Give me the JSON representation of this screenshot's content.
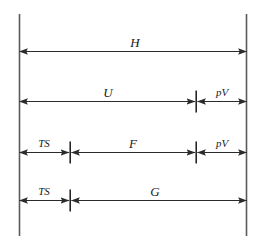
{
  "figure": {
    "type": "thermodynamic-potentials-bar-diagram",
    "colors": {
      "rule": "#5a5a5a",
      "arrow": "#2b2b2b",
      "tick": "#1a1a1a",
      "text": "#1a1a1a",
      "background": "#ffffff",
      "caption": "#cfcfcf"
    },
    "boundaries": {
      "left_rail": {
        "name": "left-boundary-line",
        "x": 19,
        "y_top": 14,
        "y_bottom": 236
      },
      "right_rail": {
        "name": "right-boundary-line",
        "x": 246,
        "y_top": 14,
        "y_bottom": 236
      }
    },
    "rows": [
      {
        "id": "row-h",
        "y": 51,
        "segments": [
          {
            "id": "seg-h",
            "label": "H",
            "label_size": "main",
            "x1": 19,
            "x2": 246,
            "label_x": 135,
            "label_y": 42,
            "arrow_start": true,
            "arrow_end": true
          }
        ],
        "ticks": []
      },
      {
        "id": "row-u-pv",
        "y": 101,
        "segments": [
          {
            "id": "seg-u",
            "label": "U",
            "label_size": "main",
            "x1": 19,
            "x2": 195,
            "label_x": 108,
            "label_y": 92,
            "arrow_start": true,
            "arrow_end": true
          },
          {
            "id": "seg-pv-upper",
            "label": "pV",
            "label_size": "small",
            "x1": 197,
            "x2": 246,
            "label_x": 222,
            "label_y": 92,
            "arrow_start": true,
            "arrow_end": true
          }
        ],
        "ticks": [
          {
            "id": "tick-u-pv",
            "x": 196,
            "half_height": 11
          }
        ]
      },
      {
        "id": "row-ts-f-pv",
        "y": 152,
        "segments": [
          {
            "id": "seg-ts-upper",
            "label": "TS",
            "label_size": "small",
            "x1": 19,
            "x2": 69,
            "label_x": 44,
            "label_y": 143,
            "arrow_start": true,
            "arrow_end": true
          },
          {
            "id": "seg-f",
            "label": "F",
            "label_size": "main",
            "x1": 71,
            "x2": 195,
            "label_x": 133,
            "label_y": 143,
            "arrow_start": true,
            "arrow_end": true
          },
          {
            "id": "seg-pv-lower",
            "label": "pV",
            "label_size": "small",
            "x1": 197,
            "x2": 246,
            "label_x": 222,
            "label_y": 143,
            "arrow_start": true,
            "arrow_end": true
          }
        ],
        "ticks": [
          {
            "id": "tick-ts-f",
            "x": 70,
            "half_height": 11
          },
          {
            "id": "tick-f-pv",
            "x": 196,
            "half_height": 11
          }
        ]
      },
      {
        "id": "row-ts-g",
        "y": 200,
        "segments": [
          {
            "id": "seg-ts-lower",
            "label": "TS",
            "label_size": "small",
            "x1": 19,
            "x2": 69,
            "label_x": 44,
            "label_y": 191,
            "arrow_start": true,
            "arrow_end": true
          },
          {
            "id": "seg-g",
            "label": "G",
            "label_size": "main",
            "x1": 71,
            "x2": 246,
            "label_x": 155,
            "label_y": 191,
            "arrow_start": true,
            "arrow_end": true
          }
        ],
        "ticks": [
          {
            "id": "tick-ts-g",
            "x": 70,
            "half_height": 11
          }
        ]
      }
    ],
    "labels": {
      "h": "H",
      "u": "U",
      "pv_upper": "pV",
      "ts_upper": "TS",
      "f": "F",
      "pv_lower": "pV",
      "ts_lower": "TS",
      "g": "G"
    },
    "caption": ""
  }
}
